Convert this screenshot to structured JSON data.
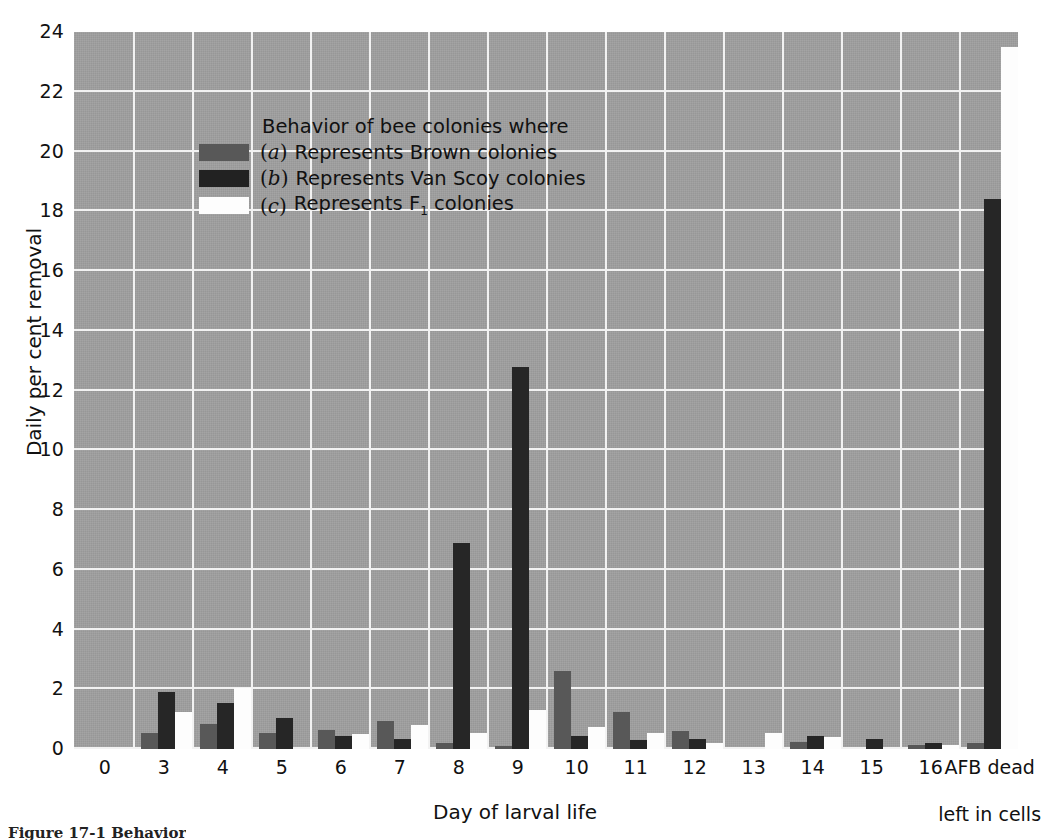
{
  "chart_data": {
    "type": "bar",
    "title": "",
    "xlabel": "Day of larval life",
    "ylabel": "Daily per cent removal",
    "ylim": [
      0,
      24
    ],
    "ytick_step": 2,
    "grid": true,
    "legend_position": "inside-top-left",
    "legend_title": "Behavior of bee colonies where",
    "categories": [
      "0",
      "3",
      "4",
      "5",
      "6",
      "7",
      "8",
      "9",
      "10",
      "11",
      "12",
      "13",
      "14",
      "15",
      "16",
      "AFB dead\nleft in cells"
    ],
    "series": [
      {
        "name": "(a) Represents Brown colonies",
        "key": "a",
        "color": "#585858",
        "values": [
          0,
          0.55,
          0.85,
          0.55,
          0.65,
          0.95,
          0.2,
          0.1,
          2.6,
          1.25,
          0.6,
          0,
          0.25,
          0,
          0.12,
          0.2
        ]
      },
      {
        "name": "(b) Represents Van Scoy colonies",
        "key": "b",
        "color": "#262626",
        "values": [
          0,
          1.9,
          1.55,
          1.05,
          0.45,
          0.35,
          6.9,
          12.8,
          0.45,
          0.3,
          0.35,
          0,
          0.45,
          0.35,
          0.2,
          18.4
        ]
      },
      {
        "name": "(c) Represents F1 colonies",
        "key": "c",
        "color": "#fdfdfd",
        "values": [
          0,
          1.25,
          2.05,
          0,
          0.5,
          0.8,
          0.55,
          1.3,
          0.75,
          0.55,
          0.2,
          0.55,
          0.4,
          0,
          0.12,
          23.5
        ]
      }
    ]
  },
  "axes": {
    "y_ticks": [
      "24",
      "22",
      "20",
      "18",
      "16",
      "14",
      "12",
      "10",
      "8",
      "6",
      "4",
      "2",
      "0"
    ],
    "y_title": "Daily per cent removal",
    "x_title": "Day of larval life",
    "x_ticks": [
      {
        "label": "0"
      },
      {
        "label": "3"
      },
      {
        "label": "4"
      },
      {
        "label": "5"
      },
      {
        "label": "6"
      },
      {
        "label": "7"
      },
      {
        "label": "8"
      },
      {
        "label": "9"
      },
      {
        "label": "10"
      },
      {
        "label": "11"
      },
      {
        "label": "12"
      },
      {
        "label": "13"
      },
      {
        "label": "14"
      },
      {
        "label": "15"
      },
      {
        "label": "16"
      },
      {
        "label": "AFB dead"
      },
      {
        "label": "left in cells"
      }
    ]
  },
  "legend": {
    "title": "Behavior of bee colonies where",
    "rows": [
      {
        "symbol": "a",
        "text": "Represents Brown colonies",
        "swatch": "a"
      },
      {
        "symbol": "b",
        "text": "Represents Van Scoy colonies",
        "swatch": "b"
      },
      {
        "symbol": "c",
        "text": "Represents F",
        "text_sub": "1",
        "text_tail": " colonies",
        "swatch": "c"
      }
    ]
  },
  "caption": {
    "text": "Figure 17-1  Behavior"
  },
  "colors": {
    "plot_background": "#a0a0a0",
    "grid": "#f2f2f2",
    "series_a": "#585858",
    "series_b": "#262626",
    "series_c": "#fdfdfd",
    "text": "#111111"
  }
}
